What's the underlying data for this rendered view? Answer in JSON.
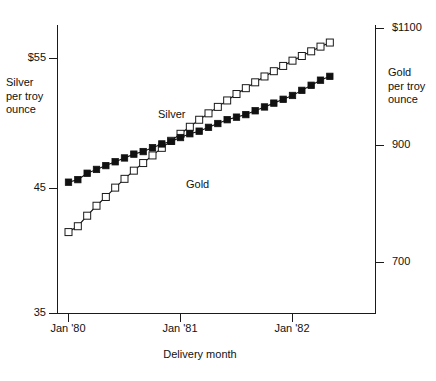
{
  "chart_data": {
    "type": "line",
    "title": "",
    "subtitle": "",
    "xlabel": "Delivery month",
    "ylabel": "Silver per troy ounce",
    "y2label": "Gold per troy ounce",
    "grid": false,
    "legend_position": "inline-annotation",
    "x_tick_labels": [
      "Jan '80",
      "Jan '81",
      "Jan '82"
    ],
    "x_tick_values": [
      0,
      12,
      24
    ],
    "xlim": [
      -2,
      30
    ],
    "left_axis": {
      "name": "Silver per troy ounce",
      "tick_labels": [
        "$55",
        "45",
        "35"
      ],
      "tick_values": [
        55,
        45,
        35
      ],
      "ylim": [
        35,
        57
      ]
    },
    "right_axis": {
      "name": "Gold per troy ounce",
      "tick_labels": [
        "$1100",
        "900",
        "700"
      ],
      "tick_values": [
        1100,
        900,
        700
      ],
      "ylim": [
        612,
        1135
      ]
    },
    "series": [
      {
        "name": "Silver",
        "axis": "left",
        "marker": "filled-square",
        "units": "dollars per troy ounce",
        "x": [
          0,
          1,
          2,
          3,
          4,
          5,
          6,
          7,
          8,
          9,
          10,
          11,
          12,
          13,
          14,
          15,
          16,
          17,
          18,
          19,
          20,
          21,
          22,
          23,
          24,
          25,
          26,
          27,
          28
        ],
        "values": [
          45.3,
          45.5,
          46.0,
          46.3,
          46.6,
          46.9,
          47.2,
          47.5,
          47.7,
          48.0,
          48.3,
          48.5,
          48.8,
          49.1,
          49.3,
          49.6,
          49.9,
          50.2,
          50.4,
          50.6,
          50.9,
          51.2,
          51.5,
          51.8,
          52.1,
          52.5,
          52.9,
          53.3,
          53.6
        ]
      },
      {
        "name": "Gold",
        "axis": "right",
        "marker": "open-square",
        "units": "dollars per troy ounce",
        "x": [
          0,
          1,
          2,
          3,
          4,
          5,
          6,
          7,
          8,
          9,
          10,
          11,
          12,
          13,
          14,
          15,
          16,
          17,
          18,
          19,
          20,
          21,
          22,
          23,
          24,
          25,
          26,
          27,
          28
        ],
        "values": [
          752,
          762,
          780,
          797,
          812,
          828,
          843,
          857,
          870,
          883,
          896,
          908,
          920,
          932,
          944,
          955,
          966,
          977,
          988,
          998,
          1008,
          1018,
          1027,
          1036,
          1045,
          1053,
          1061,
          1069,
          1076
        ]
      }
    ],
    "annotations": [
      {
        "text": "Silver",
        "series": "Silver"
      },
      {
        "text": "Gold",
        "series": "Gold"
      }
    ]
  },
  "axes": {
    "left_ticks": [
      "$55",
      "45",
      "35"
    ],
    "right_ticks": [
      "$1100",
      "900",
      "700"
    ],
    "x_ticks": [
      "Jan '80",
      "Jan '81",
      "Jan '82"
    ],
    "left_title": "Silver\nper troy\nounce",
    "right_title": "Gold\nper troy\nounce",
    "x_title": "Delivery month"
  },
  "series_labels": {
    "silver": "Silver",
    "gold": "Gold"
  },
  "colors": {
    "ink": "#111111",
    "background": "#ffffff",
    "silver_marker": "#111111",
    "gold_marker": "#ffffff"
  }
}
